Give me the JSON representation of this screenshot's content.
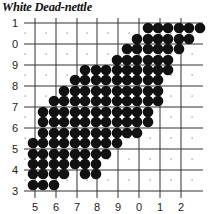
{
  "title": "White Dead-nettle",
  "map": {
    "y_labels": [
      "1",
      "0",
      "9",
      "8",
      "7",
      "6",
      "5",
      "4",
      "3"
    ],
    "x_labels": [
      "5",
      "6",
      "7",
      "8",
      "9",
      "0",
      "1",
      "2"
    ],
    "grid": {
      "x_lines": [
        35,
        56,
        77,
        97,
        118,
        139,
        160,
        181
      ],
      "y_lines": [
        23,
        44,
        65,
        86,
        107,
        128,
        149,
        170,
        191
      ],
      "x_end": 203,
      "x_start": 24,
      "y_end": 198
    },
    "dot_x": [
      33,
      43,
      54,
      64,
      75,
      85,
      96,
      106,
      117,
      127,
      137,
      148,
      158,
      168,
      179,
      189,
      200
    ],
    "dot_y": [
      28,
      39,
      49,
      60,
      70,
      80,
      91,
      101,
      112,
      122,
      133,
      143,
      154,
      164,
      174,
      185
    ],
    "occupied_rows": [
      [
        [
          11,
          16
        ]
      ],
      [
        [
          10,
          15
        ]
      ],
      [
        [
          9,
          14
        ]
      ],
      [
        [
          8,
          13
        ]
      ],
      [
        [
          5,
          13
        ]
      ],
      [
        [
          4,
          12
        ]
      ],
      [
        [
          3,
          12
        ]
      ],
      [
        [
          2,
          12
        ]
      ],
      [
        [
          1,
          11
        ]
      ],
      [
        [
          1,
          11
        ]
      ],
      [
        [
          1,
          10
        ]
      ],
      [
        [
          0,
          8
        ]
      ],
      [
        [
          0,
          7
        ]
      ],
      [
        [
          0,
          6
        ]
      ],
      [
        [
          0,
          3
        ],
        [
          5,
          6
        ]
      ],
      [
        [
          0,
          2
        ]
      ]
    ],
    "colors": {
      "dot": "#111111",
      "grid": "#333333",
      "empty_dot": "#888888"
    }
  }
}
